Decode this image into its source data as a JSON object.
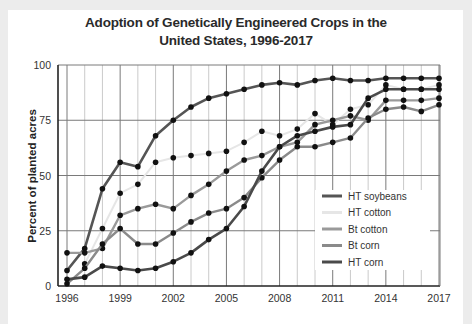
{
  "chart_data": {
    "type": "line",
    "title": "Adoption of Genetically Engineered Crops in the United States, 1996-2017",
    "title_lines": [
      "Adoption of Genetically Engineered Crops in the",
      "United States, 1996-2017"
    ],
    "xlabel": "",
    "ylabel": "Percent of planted acres",
    "ylim": [
      0,
      100
    ],
    "xlim": [
      1996,
      2017
    ],
    "x_ticks": [
      "1996",
      "1999",
      "2002",
      "2005",
      "2008",
      "2011",
      "2014",
      "2017"
    ],
    "y_ticks": [
      "0",
      "25",
      "50",
      "75",
      "100"
    ],
    "grid": true,
    "legend_position": "lower right inside",
    "x": [
      1996,
      1997,
      1998,
      1999,
      2000,
      2001,
      2002,
      2003,
      2004,
      2005,
      2006,
      2007,
      2008,
      2009,
      2010,
      2011,
      2012,
      2013,
      2014,
      2015,
      2016,
      2017
    ],
    "series": [
      {
        "name": "HT soybeans",
        "color": "#555555",
        "width": 2.6,
        "values": [
          7,
          17,
          44,
          56,
          54,
          68,
          75,
          81,
          85,
          87,
          89,
          91,
          92,
          91,
          93,
          94,
          93,
          93,
          94,
          94,
          94,
          94
        ]
      },
      {
        "name": "HT cotton",
        "color": "#e6e6e6",
        "width": 2.0,
        "values": [
          null,
          10,
          26,
          42,
          46,
          56,
          58,
          59,
          60,
          61,
          65,
          70,
          68,
          71,
          78,
          73,
          80,
          82,
          91,
          89,
          89,
          91
        ]
      },
      {
        "name": "Bt cotton",
        "color": "#9a9a9a",
        "width": 2.4,
        "values": [
          15,
          15,
          17,
          32,
          35,
          37,
          35,
          41,
          46,
          52,
          57,
          59,
          63,
          65,
          73,
          75,
          77,
          75,
          84,
          84,
          84,
          85
        ]
      },
      {
        "name": "Bt corn",
        "color": "#8a8a8a",
        "width": 2.4,
        "values": [
          1,
          8,
          19,
          26,
          19,
          19,
          24,
          29,
          33,
          35,
          40,
          49,
          57,
          63,
          63,
          65,
          67,
          76,
          80,
          81,
          79,
          82
        ]
      },
      {
        "name": "HT corn",
        "color": "#4a4a4a",
        "width": 2.6,
        "values": [
          3,
          4,
          9,
          8,
          7,
          8,
          11,
          15,
          21,
          26,
          36,
          52,
          63,
          68,
          70,
          72,
          73,
          85,
          89,
          89,
          89,
          89
        ]
      }
    ]
  }
}
